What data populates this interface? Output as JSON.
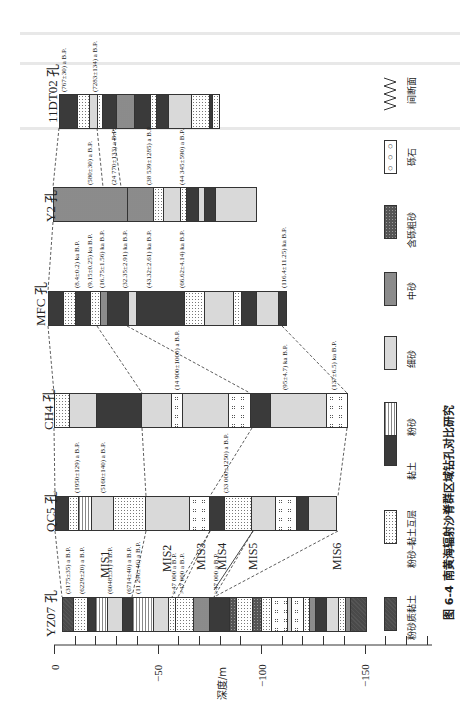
{
  "figure": {
    "caption": "图 6-4   南黄海辐射沙脊群区域钻孔对比研究",
    "axis": {
      "label": "深度/m",
      "ticks": [
        "0",
        "−50",
        "−100",
        "−150"
      ]
    }
  },
  "legend": [
    {
      "key": "sandy-clay",
      "label": "粉砂质黏土",
      "pattern": "p-sandyclay"
    },
    {
      "key": "silt-clay",
      "label": "粉砂–黏土互层",
      "pattern": "p-siltclay"
    },
    {
      "key": "clay",
      "label": "黏土",
      "pattern": "p-clay"
    },
    {
      "key": "silt",
      "label": "粉砂",
      "pattern": "p-silt"
    },
    {
      "key": "fine-sand",
      "label": "细砂",
      "pattern": "p-fine"
    },
    {
      "key": "medium-sand",
      "label": "中砂",
      "pattern": "p-medium"
    },
    {
      "key": "gravelly-coarse-sand",
      "label": "含砾粗砂",
      "pattern": "p-coarse"
    },
    {
      "key": "gravel",
      "label": "砾石",
      "pattern": "p-gravel"
    },
    {
      "key": "unconformity",
      "label": "间断面",
      "pattern": "wave"
    }
  ],
  "boreholes": [
    {
      "name": "11DT02 孔",
      "dates": [
        "(767±30) a B.P.",
        "(7283±134) a B.P."
      ],
      "layers": [
        [
          "p-clay",
          18
        ],
        [
          "p-siltclay",
          12
        ],
        [
          "p-fine",
          8
        ],
        [
          "p-siltclay",
          6
        ],
        [
          "p-clay",
          14
        ],
        [
          "p-medium",
          18
        ],
        [
          "p-clay",
          16
        ],
        [
          "p-siltclay",
          6
        ],
        [
          "p-clay",
          12
        ],
        [
          "p-fine",
          24
        ],
        [
          "p-siltclay",
          18
        ],
        [
          "p-clay",
          3
        ],
        [
          "p-siltclay",
          6
        ]
      ]
    },
    {
      "name": "Y2 孔",
      "dates": [
        "(580±30) a B.P.",
        "(24 770±133) a B.P.",
        "(38 539±1285) a B.P.",
        "(44 345±590) a B.P."
      ],
      "layers": [
        [
          "p-medium",
          75
        ],
        [
          "p-medium",
          26
        ],
        [
          "p-siltclay",
          10
        ],
        [
          "p-fine",
          17
        ],
        [
          "p-siltclay",
          6
        ],
        [
          "p-clay",
          12
        ],
        [
          "p-fine",
          6
        ],
        [
          "p-clay",
          12
        ],
        [
          "p-fine",
          40
        ]
      ]
    },
    {
      "name": "MFC 孔",
      "dates": [
        "(8.4±0.2) ka B.P.",
        "(9.15±0.25) ka B.P.",
        "(16.75±1.56) ka B.P.",
        "(32.35±2.91) ka B.P.",
        "(43.32±2.61) ka B.P.",
        "(66.62±4.14) ka B.P.",
        "(116.4±11.25) ka B.P."
      ],
      "layers": [
        [
          "p-clay",
          15
        ],
        [
          "p-siltclay",
          12
        ],
        [
          "p-clay",
          15
        ],
        [
          "p-siltclay",
          10
        ],
        [
          "p-medium",
          7
        ],
        [
          "p-clay",
          22
        ],
        [
          "p-fine",
          8
        ],
        [
          "p-clay",
          48
        ],
        [
          "p-siltclay",
          20
        ],
        [
          "p-fine",
          30
        ],
        [
          "p-siltclay",
          8
        ],
        [
          "p-clay",
          15
        ],
        [
          "p-fine",
          22
        ],
        [
          "p-clay",
          7
        ]
      ]
    },
    {
      "name": "CH4 孔",
      "dates": [
        "(14 900±1000) a B.P.",
        "(95±4.7) ka B.P.",
        "(137±6.5) ka B.P."
      ],
      "layers": [
        [
          "p-siltclay",
          15
        ],
        [
          "p-fine",
          27
        ],
        [
          "p-clay",
          46
        ],
        [
          "p-fine",
          30
        ],
        [
          "p-gravel",
          11
        ],
        [
          "p-fine",
          46
        ],
        [
          "p-gravel",
          22
        ],
        [
          "p-clay",
          20
        ],
        [
          "p-fine",
          57
        ],
        [
          "p-gravel",
          20
        ]
      ]
    },
    {
      "name": "QC5 孔",
      "dates": [
        "(1950±129) a B.P.",
        "(5160±140) a B.P.",
        "(33 000±1250) a B.P."
      ],
      "layers": [
        [
          "p-clay",
          13
        ],
        [
          "p-siltclay",
          10
        ],
        [
          "p-silt",
          13
        ],
        [
          "p-fine",
          22
        ],
        [
          "p-siltclay",
          33
        ],
        [
          "p-fine",
          44
        ],
        [
          "p-gravel",
          20
        ],
        [
          "p-clay",
          15
        ],
        [
          "p-siltclay",
          27
        ],
        [
          "p-fine",
          25
        ],
        [
          "p-gravel",
          21
        ],
        [
          "p-clay",
          12
        ],
        [
          "p-fine",
          27
        ]
      ]
    },
    {
      "name": "YZ07 孔",
      "dates": [
        "(3175±35) a B.P.",
        "(6229±20) a B.P.",
        "(6048±31) a B.P.",
        "(6714±40) a B.P.",
        "(11 296±46) a B.P.",
        ">47 000 a B.P.",
        ">47 000 a B.P.",
        ">47 000 a B.P."
      ],
      "layers": [
        [
          "p-sandyclay",
          11
        ],
        [
          "p-siltclay",
          14
        ],
        [
          "p-clay",
          8
        ],
        [
          "p-silt",
          12
        ],
        [
          "p-fine",
          15
        ],
        [
          "p-clay",
          10
        ],
        [
          "p-silt",
          22
        ],
        [
          "p-fine",
          15
        ],
        [
          "p-siltclay",
          7
        ],
        [
          "p-siltclay",
          18
        ],
        [
          "p-medium",
          16
        ],
        [
          "p-clay",
          20
        ],
        [
          "p-coarse",
          7
        ],
        [
          "p-siltclay",
          16
        ],
        [
          "p-coarse",
          9
        ],
        [
          "p-siltclay",
          10
        ],
        [
          "p-gravel",
          17
        ],
        [
          "p-fine",
          4
        ],
        [
          "p-gravel",
          12
        ],
        [
          "p-siltclay",
          6
        ],
        [
          "p-medium",
          6
        ],
        [
          "p-clay",
          11
        ],
        [
          "p-fine",
          12
        ],
        [
          "p-siltclay",
          7
        ],
        [
          "p-medium",
          5
        ],
        [
          "p-sandyclay",
          15
        ]
      ]
    }
  ],
  "mis_labels": [
    "MIS1",
    "MIS2",
    "MIS3",
    "MIS4",
    "MIS5",
    "MIS6"
  ]
}
